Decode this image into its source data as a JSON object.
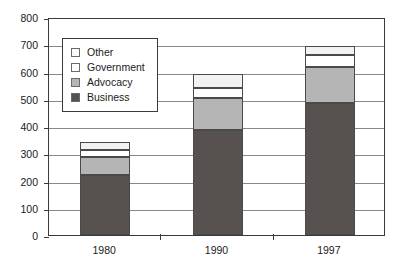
{
  "chart_data": {
    "type": "bar",
    "subtype": "stacked-vertical",
    "title": "",
    "xlabel": "",
    "ylabel": "",
    "categories": [
      "1980",
      "1990",
      "1997"
    ],
    "series": [
      {
        "name": "Business",
        "values": [
          222,
          385,
          483
        ],
        "color": "#575250"
      },
      {
        "name": "Advocacy",
        "values": [
          66,
          118,
          134
        ],
        "color": "#b5b5b5"
      },
      {
        "name": "Government",
        "values": [
          24,
          38,
          43
        ],
        "color": "#ffffff"
      },
      {
        "name": "Other",
        "values": [
          28,
          48,
          32
        ],
        "color": "#f2f2f2"
      }
    ],
    "stack_totals": [
      340,
      589,
      692
    ],
    "ylim": [
      0,
      800
    ],
    "ytick_step": 100,
    "yticks": [
      0,
      100,
      200,
      300,
      400,
      500,
      600,
      700,
      800
    ],
    "ytick_labels": [
      "0",
      "100",
      "200",
      "300",
      "400",
      "500",
      "600",
      "700",
      "800"
    ],
    "xtick_labels": [
      "1980",
      "1990",
      "1997"
    ],
    "grid": {
      "horizontal": true,
      "vertical": false
    },
    "legend": {
      "position": "upper-left-inside",
      "entries": [
        {
          "label": "Other",
          "swatch": "other"
        },
        {
          "label": "Government",
          "swatch": "government"
        },
        {
          "label": "Advocacy",
          "swatch": "advocacy"
        },
        {
          "label": "Business",
          "swatch": "business"
        }
      ]
    }
  }
}
